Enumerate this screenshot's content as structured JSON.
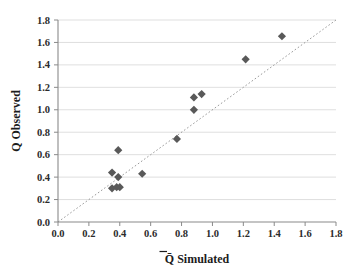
{
  "chart_data": {
    "type": "scatter",
    "title": "",
    "xlabel": "Q̄ Simulated",
    "ylabel": "Q Observed",
    "xlim": [
      0.0,
      1.8
    ],
    "ylim": [
      0.0,
      1.8
    ],
    "xticks": [
      "0.0",
      "0.2",
      "0.4",
      "0.6",
      "0.8",
      "1.0",
      "1.2",
      "1.4",
      "1.6",
      "1.8"
    ],
    "yticks": [
      "0.0",
      "0.2",
      "0.4",
      "0.6",
      "0.8",
      "1.0",
      "1.2",
      "1.4",
      "1.6",
      "1.8"
    ],
    "grid": "horizontal",
    "legend": "none",
    "marker_shape": "diamond",
    "marker_color": "#595959",
    "reference_line": {
      "label": "1:1 line",
      "style": "dotted",
      "color": "#9a9a9a",
      "from": [
        0.0,
        0.0
      ],
      "to": [
        1.8,
        1.8
      ]
    },
    "series": [
      {
        "name": "Observed vs Simulated",
        "points": [
          {
            "x": 0.35,
            "y": 0.44
          },
          {
            "x": 0.35,
            "y": 0.3
          },
          {
            "x": 0.38,
            "y": 0.31
          },
          {
            "x": 0.4,
            "y": 0.31
          },
          {
            "x": 0.39,
            "y": 0.4
          },
          {
            "x": 0.39,
            "y": 0.64
          },
          {
            "x": 0.545,
            "y": 0.43
          },
          {
            "x": 0.77,
            "y": 0.74
          },
          {
            "x": 0.88,
            "y": 1.0
          },
          {
            "x": 0.88,
            "y": 1.11
          },
          {
            "x": 0.93,
            "y": 1.14
          },
          {
            "x": 1.215,
            "y": 1.45
          },
          {
            "x": 1.45,
            "y": 1.655
          }
        ]
      }
    ]
  },
  "axis": {
    "x_title": "Q̄ Simulated",
    "x_title_q": "Q",
    "x_title_rest": " Simulated",
    "y_title": "Q Observed"
  }
}
